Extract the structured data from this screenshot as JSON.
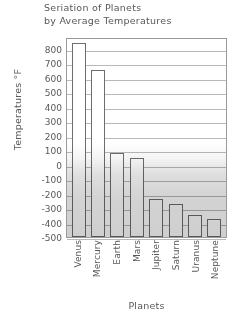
{
  "chart_data": {
    "type": "bar",
    "title": "Seriation of Planets by Average Temperatures",
    "title_lines": [
      "Seriation of Planets",
      "by Average Temperatures"
    ],
    "xlabel": "Planets",
    "ylabel": "Temperatures °F",
    "categories": [
      "Venus",
      "Mercury",
      "Earth",
      "Mars",
      "Jupiter",
      "Saturn",
      "Uranus",
      "Neptune"
    ],
    "values": [
      840,
      650,
      80,
      45,
      -235,
      -275,
      -350,
      -375
    ],
    "ylim": [
      -500,
      880
    ],
    "yticks": [
      800,
      700,
      600,
      500,
      400,
      300,
      200,
      100,
      0,
      -100,
      -200,
      -300,
      -400,
      -500
    ],
    "ytick_labels": [
      "800",
      "700",
      "600",
      "500",
      "400",
      "300",
      "200",
      "100",
      "0",
      "-100",
      "-200",
      "-300",
      "-400",
      "-500"
    ],
    "grid": true,
    "legend": false,
    "bar_baseline": -500,
    "colors": {
      "bar_fill": "#ffffff",
      "bar_edge": "#6d6d6d",
      "gridline": "#b8b8b8",
      "axis": "#9a9a9a",
      "text": "#58585a",
      "background": "#ffffff"
    }
  }
}
